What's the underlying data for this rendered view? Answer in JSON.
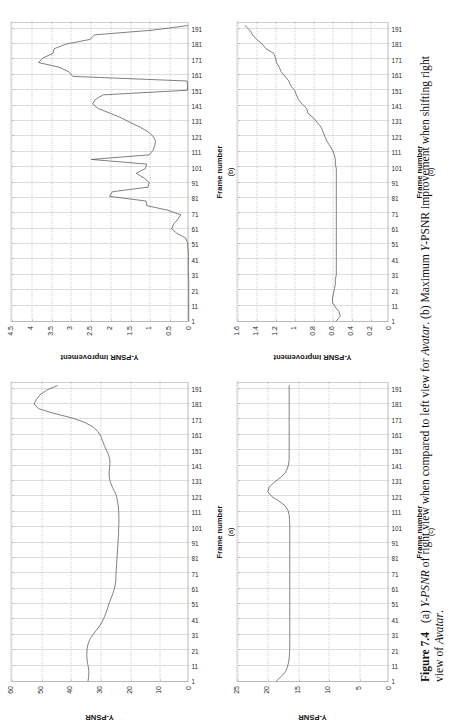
{
  "figure": {
    "number": "Figure 7.4",
    "caption_a": "(a) ",
    "caption_a_italic": "Y-PSNR",
    "caption_a_rest": " of right view when compared to left view for ",
    "caption_a_italic2": "Avatar",
    "caption_a_end": ". ",
    "caption_b": "(b) Maximum ",
    "caption_b_italic": "Y",
    "caption_b_rest": "-PSNR improvement when shifting right view of ",
    "caption_b_italic2": "Avatar",
    "caption_b_end": "."
  },
  "common": {
    "xlabel": "Frame number",
    "xticks": [
      "1",
      "11",
      "21",
      "31",
      "41",
      "51",
      "61",
      "71",
      "81",
      "91",
      "101",
      "111",
      "121",
      "131",
      "141",
      "151",
      "161",
      "171",
      "181",
      "191"
    ]
  },
  "chart_data": [
    {
      "id": "a",
      "type": "line",
      "subcaption": "(a)",
      "title": "",
      "xlabel": "Frame number",
      "ylabel": "Y-PSNR",
      "xlim": [
        1,
        196
      ],
      "ylim": [
        0,
        60
      ],
      "yticks": [
        "0",
        "10",
        "20",
        "30",
        "40",
        "50",
        "60"
      ],
      "ytick_values": [
        0,
        10,
        20,
        30,
        40,
        50,
        60
      ],
      "grid": "both-dotted",
      "x": [
        1,
        4,
        7,
        10,
        13,
        16,
        19,
        22,
        25,
        28,
        31,
        34,
        37,
        40,
        43,
        46,
        49,
        52,
        55,
        58,
        61,
        64,
        67,
        70,
        73,
        76,
        79,
        82,
        85,
        88,
        91,
        94,
        97,
        100,
        103,
        106,
        109,
        112,
        115,
        118,
        121,
        124,
        127,
        130,
        133,
        136,
        139,
        142,
        145,
        148,
        151,
        154,
        157,
        160,
        163,
        166,
        169,
        172,
        175,
        178,
        181,
        184,
        187,
        190,
        193
      ],
      "values": [
        34.2,
        34.0,
        33.9,
        34.1,
        34.4,
        34.6,
        34.6,
        34.5,
        34.2,
        33.6,
        32.6,
        31.4,
        30.2,
        29.3,
        28.6,
        28.0,
        27.5,
        27.0,
        26.4,
        25.8,
        25.3,
        25.0,
        24.8,
        24.8,
        24.7,
        24.6,
        24.5,
        24.4,
        24.3,
        24.2,
        24.1,
        24.0,
        23.9,
        23.9,
        23.8,
        23.8,
        23.8,
        23.9,
        24.0,
        24.3,
        24.6,
        25.2,
        26.0,
        26.6,
        27.0,
        27.1,
        27.0,
        26.8,
        26.9,
        27.3,
        28.0,
        28.7,
        29.3,
        29.9,
        30.8,
        32.4,
        35.2,
        39.6,
        45.8,
        50.8,
        52.4,
        51.6,
        50.4,
        48.2,
        44.6
      ]
    },
    {
      "id": "b",
      "type": "line",
      "subcaption": "(b)",
      "title": "",
      "xlabel": "Frame number",
      "ylabel": "Y-PSNR improvement",
      "xlim": [
        1,
        196
      ],
      "ylim": [
        0,
        4.5
      ],
      "yticks": [
        "0",
        "0.5",
        "1",
        "1.5",
        "2",
        "2.5",
        "3",
        "3.5",
        "4",
        "4.5"
      ],
      "ytick_values": [
        0,
        0.5,
        1,
        1.5,
        2,
        2.5,
        3,
        3.5,
        4,
        4.5
      ],
      "grid": "both-dotted",
      "x": [
        1,
        4,
        7,
        10,
        13,
        16,
        19,
        22,
        25,
        28,
        31,
        34,
        37,
        40,
        43,
        46,
        49,
        52,
        55,
        58,
        61,
        64,
        67,
        70,
        73,
        76,
        79,
        82,
        85,
        88,
        91,
        94,
        97,
        100,
        103,
        106,
        109,
        112,
        115,
        118,
        121,
        124,
        127,
        130,
        133,
        136,
        139,
        142,
        145,
        148,
        151,
        154,
        157,
        160,
        163,
        166,
        169,
        172,
        175,
        178,
        181,
        184,
        187,
        190,
        193
      ],
      "values": [
        0.02,
        0.02,
        0.02,
        0.02,
        0.02,
        0.02,
        0.02,
        0.02,
        0.02,
        0.02,
        0.03,
        0.03,
        0.03,
        0.03,
        0.03,
        0.03,
        0.04,
        0.05,
        0.1,
        0.32,
        0.45,
        0.4,
        0.3,
        0.22,
        0.55,
        1.08,
        1.1,
        2.02,
        1.95,
        1.05,
        1.02,
        1.15,
        1.35,
        1.12,
        1.08,
        2.48,
        1.02,
        0.92,
        0.88,
        0.86,
        0.92,
        1.05,
        1.25,
        1.5,
        1.72,
        2.0,
        2.3,
        2.45,
        2.38,
        2.18,
        0.05,
        0.05,
        0.06,
        2.95,
        3.05,
        3.3,
        3.82,
        3.7,
        3.45,
        3.42,
        3.12,
        2.52,
        2.4,
        0.95,
        0.05
      ]
    },
    {
      "id": "c",
      "type": "line",
      "subcaption": "(c)",
      "title": "",
      "xlabel": "Frame number",
      "ylabel": "Y-PSNR",
      "xlim": [
        1,
        196
      ],
      "ylim": [
        0,
        25
      ],
      "yticks": [
        "0",
        "5",
        "10",
        "15",
        "20",
        "25"
      ],
      "ytick_values": [
        0,
        5,
        10,
        15,
        20,
        25
      ],
      "grid": "both-dotted",
      "x": [
        1,
        4,
        7,
        10,
        13,
        16,
        19,
        22,
        25,
        28,
        31,
        34,
        37,
        40,
        43,
        46,
        49,
        52,
        55,
        58,
        61,
        64,
        67,
        70,
        73,
        76,
        79,
        82,
        85,
        88,
        91,
        94,
        97,
        100,
        103,
        106,
        109,
        112,
        115,
        118,
        121,
        124,
        127,
        130,
        133,
        136,
        139,
        142,
        145,
        148,
        151,
        154,
        157,
        160,
        163,
        166,
        169,
        172,
        175,
        178,
        181,
        184,
        187,
        190,
        193
      ],
      "values": [
        18.6,
        17.8,
        17.1,
        16.8,
        16.6,
        16.5,
        16.45,
        16.4,
        16.4,
        16.4,
        16.4,
        16.4,
        16.4,
        16.4,
        16.4,
        16.4,
        16.4,
        16.4,
        16.4,
        16.4,
        16.4,
        16.4,
        16.4,
        16.4,
        16.4,
        16.4,
        16.4,
        16.4,
        16.4,
        16.4,
        16.4,
        16.4,
        16.4,
        16.4,
        16.4,
        16.45,
        16.5,
        16.7,
        17.2,
        18.2,
        19.4,
        20.0,
        19.8,
        19.0,
        18.0,
        17.2,
        16.8,
        16.6,
        16.5,
        16.5,
        16.5,
        16.5,
        16.5,
        16.5,
        16.5,
        16.5,
        16.5,
        16.5,
        16.5,
        16.5,
        16.5,
        16.5,
        16.5,
        16.5,
        16.5
      ]
    },
    {
      "id": "d",
      "type": "line",
      "subcaption": "(d)",
      "title": "",
      "xlabel": "Frame number",
      "ylabel": "Y-PSNR improvement",
      "xlim": [
        1,
        196
      ],
      "ylim": [
        0,
        1.6
      ],
      "yticks": [
        "0",
        "0.2",
        "0.4",
        "0.6",
        "0.8",
        "1",
        "1.2",
        "1.4",
        "1.6"
      ],
      "ytick_values": [
        0,
        0.2,
        0.4,
        0.6,
        0.8,
        1,
        1.2,
        1.4,
        1.6
      ],
      "grid": "both-dotted",
      "x": [
        1,
        4,
        7,
        10,
        13,
        16,
        19,
        22,
        25,
        28,
        31,
        34,
        37,
        40,
        43,
        46,
        49,
        52,
        55,
        58,
        61,
        64,
        67,
        70,
        73,
        76,
        79,
        82,
        85,
        88,
        91,
        94,
        97,
        100,
        103,
        106,
        109,
        112,
        115,
        118,
        121,
        124,
        127,
        130,
        133,
        136,
        139,
        142,
        145,
        148,
        151,
        154,
        157,
        160,
        163,
        166,
        169,
        172,
        175,
        178,
        181,
        184,
        187,
        190,
        193
      ],
      "values": [
        0.56,
        0.52,
        0.53,
        0.57,
        0.6,
        0.6,
        0.59,
        0.58,
        0.57,
        0.57,
        0.56,
        0.56,
        0.56,
        0.56,
        0.56,
        0.56,
        0.56,
        0.56,
        0.56,
        0.56,
        0.56,
        0.56,
        0.56,
        0.56,
        0.56,
        0.56,
        0.56,
        0.56,
        0.56,
        0.56,
        0.56,
        0.56,
        0.56,
        0.56,
        0.57,
        0.57,
        0.58,
        0.6,
        0.63,
        0.66,
        0.68,
        0.7,
        0.72,
        0.76,
        0.8,
        0.86,
        0.87,
        0.92,
        0.96,
        0.98,
        1.0,
        1.04,
        1.06,
        1.1,
        1.14,
        1.16,
        1.19,
        1.2,
        1.22,
        1.3,
        1.34,
        1.4,
        1.44,
        1.47,
        1.52
      ]
    }
  ]
}
